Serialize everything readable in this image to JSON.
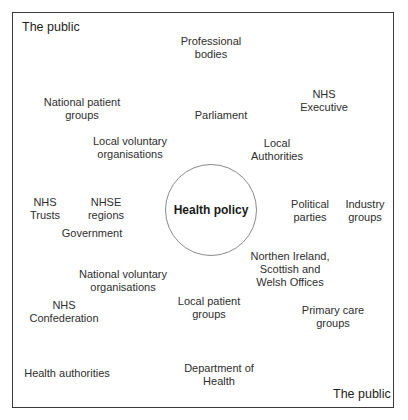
{
  "diagram": {
    "corner_top_left": "The public",
    "corner_bottom_right": "The public",
    "center": "Health policy",
    "stakeholders": [
      {
        "id": "professional-bodies",
        "lines": [
          "Professional",
          "bodies"
        ]
      },
      {
        "id": "national-patient-groups",
        "lines": [
          "National patient",
          "groups"
        ]
      },
      {
        "id": "nhs-executive",
        "lines": [
          "NHS",
          "Executive"
        ]
      },
      {
        "id": "parliament",
        "lines": [
          "Parliament"
        ]
      },
      {
        "id": "local-voluntary-organisations",
        "lines": [
          "Local voluntary",
          "organisations"
        ]
      },
      {
        "id": "local-authorities",
        "lines": [
          "Local",
          "Authorities"
        ]
      },
      {
        "id": "nhs-trusts",
        "lines": [
          "NHS",
          "Trusts"
        ]
      },
      {
        "id": "nhse-regions",
        "lines": [
          "NHSE",
          "regions"
        ]
      },
      {
        "id": "government",
        "lines": [
          "Government"
        ]
      },
      {
        "id": "political-parties",
        "lines": [
          "Political",
          "parties"
        ]
      },
      {
        "id": "industry-groups",
        "lines": [
          "Industry",
          "groups"
        ]
      },
      {
        "id": "national-voluntary-organisations",
        "lines": [
          "National voluntary",
          "organisations"
        ]
      },
      {
        "id": "devolved-offices",
        "lines": [
          "Northen Ireland,",
          "Scottish and",
          "Welsh Offices"
        ]
      },
      {
        "id": "nhs-confederation",
        "lines": [
          "NHS",
          "Confederation"
        ]
      },
      {
        "id": "local-patient-groups",
        "lines": [
          "Local patient",
          "groups"
        ]
      },
      {
        "id": "primary-care-groups",
        "lines": [
          "Primary care",
          "groups"
        ]
      },
      {
        "id": "health-authorities",
        "lines": [
          "Health authorities"
        ]
      },
      {
        "id": "department-of-health",
        "lines": [
          "Department of",
          "Health"
        ]
      }
    ]
  }
}
